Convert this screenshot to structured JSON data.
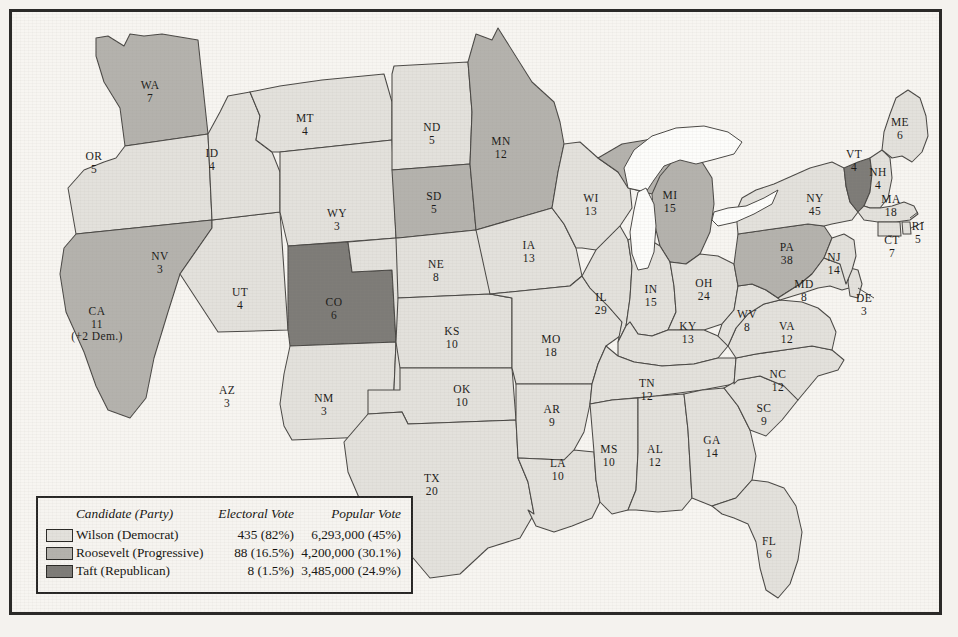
{
  "colors": {
    "wilson": "#e3e1dc",
    "roosevelt": "#b4b2ad",
    "taft": "#7d7b77",
    "lake": "#fdfdfb",
    "outline": "#4a4845",
    "paper": "#f7f5f1",
    "frame": "#2b2a28",
    "text": "#1b1a18"
  },
  "legend": {
    "headers": {
      "candidate": "Candidate (Party)",
      "electoral": "Electoral Vote",
      "popular": "Popular Vote"
    },
    "rows": [
      {
        "key": "wilson",
        "candidate": "Wilson (Democrat)",
        "electoral": "435 (82%)",
        "popular": "6,293,000 (45%)",
        "swatch": "#e3e1dc"
      },
      {
        "key": "roosevelt",
        "candidate": "Roosevelt (Progressive)",
        "electoral": "88 (16.5%)",
        "popular": "4,200,000 (30.1%)",
        "swatch": "#b4b2ad"
      },
      {
        "key": "taft",
        "candidate": "Taft (Republican)",
        "electoral": "8 (1.5%)",
        "popular": "3,485,000 (24.9%)",
        "swatch": "#7d7b77"
      }
    ]
  },
  "chart_data": {
    "type": "map",
    "legend_position": "bottom-left",
    "categories": [
      "Wilson (Democrat)",
      "Roosevelt (Progressive)",
      "Taft (Republican)"
    ],
    "series": [
      {
        "name": "Electoral Vote",
        "values": [
          435,
          88,
          8
        ]
      },
      {
        "name": "Popular Vote",
        "values": [
          6293000,
          4200000,
          3485000
        ]
      },
      {
        "name": "Electoral Vote Percent",
        "values": [
          82,
          16.5,
          1.5
        ]
      },
      {
        "name": "Popular Vote Percent",
        "values": [
          45,
          30.1,
          24.9
        ]
      }
    ],
    "states": [
      {
        "code": "WA",
        "ev": "7",
        "winner": "roosevelt",
        "lx": 138,
        "ly": 77
      },
      {
        "code": "OR",
        "ev": "5",
        "winner": "wilson",
        "lx": 82,
        "ly": 148
      },
      {
        "code": "CA",
        "ev": "11",
        "winner": "roosevelt",
        "lx": 85,
        "ly": 303,
        "note": "(+2 Dem.)"
      },
      {
        "code": "NV",
        "ev": "3",
        "winner": "wilson",
        "lx": 148,
        "ly": 248
      },
      {
        "code": "ID",
        "ev": "4",
        "winner": "wilson",
        "lx": 200,
        "ly": 145
      },
      {
        "code": "MT",
        "ev": "4",
        "winner": "wilson",
        "lx": 293,
        "ly": 110
      },
      {
        "code": "WY",
        "ev": "3",
        "winner": "wilson",
        "lx": 325,
        "ly": 205
      },
      {
        "code": "UT",
        "ev": "4",
        "winner": "taft",
        "lx": 228,
        "ly": 284
      },
      {
        "code": "AZ",
        "ev": "3",
        "winner": "wilson",
        "lx": 215,
        "ly": 382
      },
      {
        "code": "CO",
        "ev": "6",
        "winner": "wilson",
        "lx": 322,
        "ly": 294
      },
      {
        "code": "NM",
        "ev": "3",
        "winner": "wilson",
        "lx": 312,
        "ly": 390
      },
      {
        "code": "ND",
        "ev": "5",
        "winner": "wilson",
        "lx": 420,
        "ly": 119
      },
      {
        "code": "SD",
        "ev": "5",
        "winner": "roosevelt",
        "lx": 422,
        "ly": 188
      },
      {
        "code": "NE",
        "ev": "8",
        "winner": "wilson",
        "lx": 424,
        "ly": 256
      },
      {
        "code": "KS",
        "ev": "10",
        "winner": "wilson",
        "lx": 440,
        "ly": 323
      },
      {
        "code": "OK",
        "ev": "10",
        "winner": "wilson",
        "lx": 450,
        "ly": 381
      },
      {
        "code": "TX",
        "ev": "20",
        "winner": "wilson",
        "lx": 420,
        "ly": 470
      },
      {
        "code": "MN",
        "ev": "12",
        "winner": "roosevelt",
        "lx": 489,
        "ly": 133
      },
      {
        "code": "IA",
        "ev": "13",
        "winner": "wilson",
        "lx": 517,
        "ly": 237
      },
      {
        "code": "MO",
        "ev": "18",
        "winner": "wilson",
        "lx": 539,
        "ly": 331
      },
      {
        "code": "AR",
        "ev": "9",
        "winner": "wilson",
        "lx": 540,
        "ly": 401
      },
      {
        "code": "LA",
        "ev": "10",
        "winner": "wilson",
        "lx": 546,
        "ly": 455
      },
      {
        "code": "WI",
        "ev": "13",
        "winner": "wilson",
        "lx": 579,
        "ly": 190
      },
      {
        "code": "IL",
        "ev": "29",
        "winner": "wilson",
        "lx": 589,
        "ly": 289
      },
      {
        "code": "MS",
        "ev": "10",
        "winner": "wilson",
        "lx": 597,
        "ly": 441
      },
      {
        "code": "MI",
        "ev": "15",
        "winner": "roosevelt",
        "lx": 658,
        "ly": 187
      },
      {
        "code": "IN",
        "ev": "15",
        "winner": "wilson",
        "lx": 639,
        "ly": 281
      },
      {
        "code": "AL",
        "ev": "12",
        "winner": "wilson",
        "lx": 643,
        "ly": 441
      },
      {
        "code": "OH",
        "ev": "24",
        "winner": "wilson",
        "lx": 692,
        "ly": 275
      },
      {
        "code": "KY",
        "ev": "13",
        "winner": "wilson",
        "lx": 676,
        "ly": 318
      },
      {
        "code": "TN",
        "ev": "12",
        "winner": "wilson",
        "lx": 635,
        "ly": 375
      },
      {
        "code": "GA",
        "ev": "14",
        "winner": "wilson",
        "lx": 700,
        "ly": 432
      },
      {
        "code": "FL",
        "ev": "6",
        "winner": "wilson",
        "lx": 757,
        "ly": 533
      },
      {
        "code": "WV",
        "ev": "8",
        "winner": "wilson",
        "lx": 735,
        "ly": 306
      },
      {
        "code": "VA",
        "ev": "12",
        "winner": "wilson",
        "lx": 775,
        "ly": 318
      },
      {
        "code": "NC",
        "ev": "12",
        "winner": "wilson",
        "lx": 766,
        "ly": 366
      },
      {
        "code": "SC",
        "ev": "9",
        "winner": "wilson",
        "lx": 752,
        "ly": 400
      },
      {
        "code": "PA",
        "ev": "38",
        "winner": "roosevelt",
        "lx": 775,
        "ly": 239
      },
      {
        "code": "NY",
        "ev": "45",
        "winner": "wilson",
        "lx": 803,
        "ly": 190
      },
      {
        "code": "MD",
        "ev": "8",
        "winner": "wilson",
        "lx": 792,
        "ly": 276
      },
      {
        "code": "DE",
        "ev": "3",
        "winner": "wilson",
        "lx": 852,
        "ly": 290
      },
      {
        "code": "NJ",
        "ev": "14",
        "winner": "wilson",
        "lx": 822,
        "ly": 249
      },
      {
        "code": "VT",
        "ev": "4",
        "winner": "taft",
        "lx": 842,
        "ly": 146
      },
      {
        "code": "NH",
        "ev": "4",
        "winner": "wilson",
        "lx": 866,
        "ly": 164
      },
      {
        "code": "ME",
        "ev": "6",
        "winner": "wilson",
        "lx": 888,
        "ly": 114
      },
      {
        "code": "MA",
        "ev": "18",
        "winner": "wilson",
        "lx": 879,
        "ly": 191
      },
      {
        "code": "RI",
        "ev": "5",
        "winner": "wilson",
        "lx": 906,
        "ly": 218
      },
      {
        "code": "CT",
        "ev": "7",
        "winner": "wilson",
        "lx": 880,
        "ly": 232
      }
    ]
  }
}
